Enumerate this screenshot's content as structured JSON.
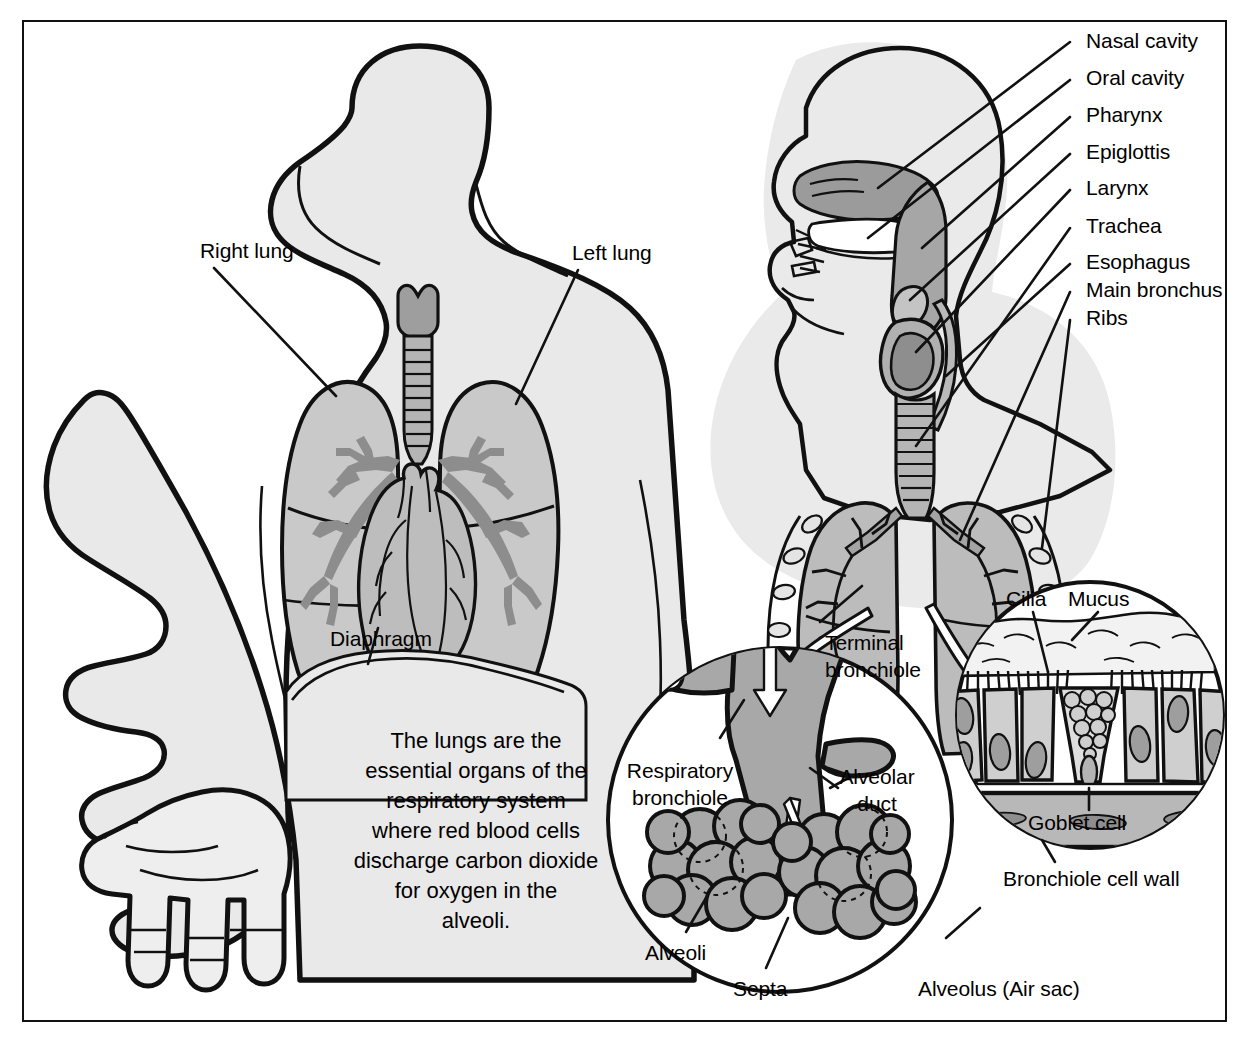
{
  "figure": {
    "kind": "anatomical-illustration"
  },
  "colors": {
    "outline": "#111111",
    "body_fill": "#e6e6e6",
    "body_fill_soft": "#ededed",
    "lung_fill": "#c6c6c6",
    "organ_mid": "#b0b0b0",
    "bronchi_dark": "#8f8f8f",
    "cell_fill": "#cfcfcf",
    "cell_dark": "#9a9a9a",
    "white": "#ffffff",
    "frame": "#111111"
  },
  "anterior_view": {
    "labels": [
      {
        "id": "right-lung",
        "text": "Right lung"
      },
      {
        "id": "left-lung",
        "text": "Left lung"
      },
      {
        "id": "diaphragm",
        "text": "Diaphragm"
      }
    ],
    "blurb": "The lungs are the\nessential organs of the\nrespiratory system\nwhere red blood cells\ndischarge carbon dioxide\nfor oxygen in the\nalveoli."
  },
  "lateral_view": {
    "labels": [
      {
        "id": "nasal-cavity",
        "text": "Nasal cavity"
      },
      {
        "id": "oral-cavity",
        "text": "Oral cavity"
      },
      {
        "id": "pharynx",
        "text": "Pharynx"
      },
      {
        "id": "epiglottis",
        "text": "Epiglottis"
      },
      {
        "id": "larynx",
        "text": "Larynx"
      },
      {
        "id": "trachea",
        "text": "Trachea"
      },
      {
        "id": "esophagus",
        "text": "Esophagus"
      },
      {
        "id": "main-bronchus",
        "text": "Main bronchus"
      },
      {
        "id": "ribs",
        "text": "Ribs"
      }
    ]
  },
  "alveolus_inset": {
    "labels": [
      {
        "id": "terminal-bronchiole",
        "text": "Terminal\nbronchiole"
      },
      {
        "id": "respiratory-bronchiole",
        "text": "Respiratory\nbronchiole"
      },
      {
        "id": "alveolar-duct",
        "text": "Alveolar\nduct"
      },
      {
        "id": "alveoli",
        "text": "Alveoli"
      },
      {
        "id": "septa",
        "text": "Septa"
      },
      {
        "id": "alveolus-air-sac",
        "text": "Alveolus (Air sac)"
      }
    ]
  },
  "cellwall_inset": {
    "labels": [
      {
        "id": "cilia",
        "text": "Cilia"
      },
      {
        "id": "mucus",
        "text": "Mucus"
      },
      {
        "id": "goblet-cell",
        "text": "Goblet cell"
      },
      {
        "id": "bronchiole-cell-wall",
        "text": "Bronchiole cell wall"
      }
    ]
  }
}
